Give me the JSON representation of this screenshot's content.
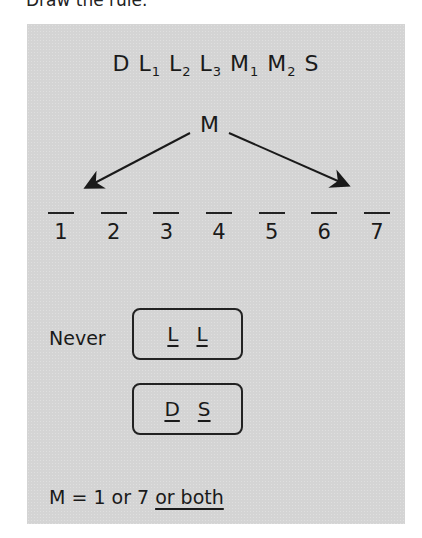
{
  "heading": "Draw the rule.",
  "variables": [
    {
      "letter": "D",
      "sub": ""
    },
    {
      "letter": "L",
      "sub": "1"
    },
    {
      "letter": "L",
      "sub": "2"
    },
    {
      "letter": "L",
      "sub": "3"
    },
    {
      "letter": "M",
      "sub": "1"
    },
    {
      "letter": "M",
      "sub": "2"
    },
    {
      "letter": "S",
      "sub": ""
    }
  ],
  "arrow_label": "M",
  "slots": [
    "1",
    "2",
    "3",
    "4",
    "5",
    "6",
    "7"
  ],
  "never_label": "Never",
  "never_pairs": [
    {
      "first": "L",
      "second": "L"
    },
    {
      "first": "D",
      "second": "S"
    }
  ],
  "formula": {
    "prefix": "M = 1 or 7 ",
    "underlined": "or both"
  },
  "colors": {
    "panel": "#d4d4d4",
    "ink": "#1a1a1a"
  }
}
